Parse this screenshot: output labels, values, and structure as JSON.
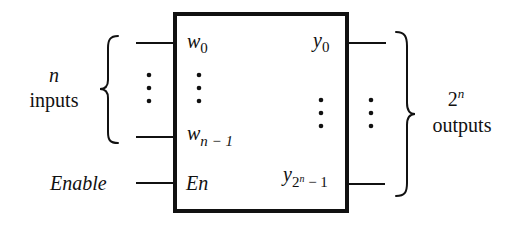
{
  "diagram": {
    "block": {
      "inputs": [
        {
          "name": "w",
          "subscript": "0"
        },
        {
          "name": "w",
          "subscript": "n − 1"
        }
      ],
      "enable": {
        "label": "En"
      },
      "outputs": [
        {
          "name": "y",
          "subscript": "0"
        },
        {
          "name": "y",
          "subscript_base": "2",
          "subscript_sup": "n",
          "subscript_tail": " − 1"
        }
      ]
    },
    "left_group": {
      "line1": "n",
      "line2": "inputs"
    },
    "right_group": {
      "line1_base": "2",
      "line1_sup": "n",
      "line2": "outputs"
    },
    "enable_label": "Enable",
    "colors": {
      "stroke": "#111111",
      "background": "#ffffff"
    }
  }
}
